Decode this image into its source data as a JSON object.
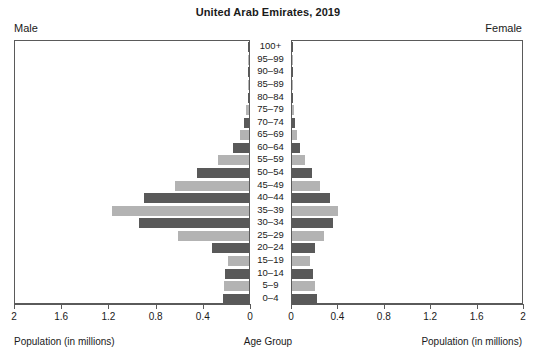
{
  "header": {
    "title": "United Arab Emirates, 2019",
    "male_corner": "Male",
    "female_corner": "Female"
  },
  "axes": {
    "male_axis_title": "Population (in millions)",
    "female_axis_title": "Population (in millions)",
    "age_axis_title": "Age Group",
    "male_ticks": [
      "2",
      "1.6",
      "1.2",
      "0.8",
      "0.4",
      "0"
    ],
    "female_ticks": [
      "0",
      "0.4",
      "0.8",
      "1.2",
      "1.6",
      "2"
    ],
    "xlim": [
      0,
      2
    ]
  },
  "colors": {
    "bar_dark": "#595959",
    "bar_light": "#b3b3b3",
    "axis": "#5a5a5a",
    "background": "#ffffff",
    "text": "#1a1a1a"
  },
  "chart_data": {
    "type": "bar",
    "subtype": "population-pyramid",
    "title": "United Arab Emirates, 2019",
    "xlabel": "Population (in millions)",
    "ylabel": "Age Group",
    "xlim": [
      0,
      2
    ],
    "grid": false,
    "legend": "none",
    "orientation": "horizontal",
    "categories": [
      "100+",
      "95–99",
      "90–94",
      "85–89",
      "80–84",
      "75–79",
      "70–74",
      "65–69",
      "60–64",
      "55–59",
      "50–54",
      "45–49",
      "40–44",
      "35–39",
      "30–34",
      "25–29",
      "20–24",
      "15–19",
      "10–14",
      "5–9",
      "0–4"
    ],
    "series": [
      {
        "name": "Male",
        "side": "left",
        "values": [
          0.002,
          0.003,
          0.004,
          0.006,
          0.012,
          0.022,
          0.045,
          0.075,
          0.135,
          0.265,
          0.44,
          0.63,
          0.89,
          1.16,
          0.93,
          0.6,
          0.31,
          0.18,
          0.2,
          0.21,
          0.22
        ]
      },
      {
        "name": "Female",
        "side": "right",
        "values": [
          0.002,
          0.003,
          0.004,
          0.005,
          0.008,
          0.014,
          0.025,
          0.04,
          0.065,
          0.11,
          0.17,
          0.245,
          0.33,
          0.4,
          0.355,
          0.28,
          0.2,
          0.155,
          0.185,
          0.2,
          0.215
        ]
      }
    ]
  }
}
